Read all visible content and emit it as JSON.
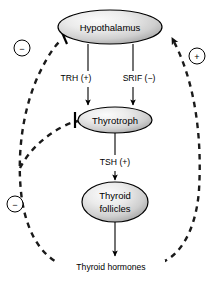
{
  "diagram": {
    "background_color": "#ffffff",
    "nodes": [
      {
        "id": "hypothalamus",
        "label": "Hypothalamus",
        "cx": 110,
        "cy": 27,
        "rx": 52,
        "ry": 17
      },
      {
        "id": "thyrotroph",
        "label": "Thyrotroph",
        "cx": 115,
        "cy": 120,
        "rx": 37,
        "ry": 13
      },
      {
        "id": "thyroid_follicles",
        "label_line1": "Thyroid",
        "label_line2": "follicles",
        "cx": 115,
        "cy": 202,
        "rx": 33,
        "ry": 20
      }
    ],
    "edge_labels": [
      {
        "id": "trh",
        "text": "TRH (+)",
        "x": 76,
        "y": 79
      },
      {
        "id": "srif",
        "text": "SRIF (−)",
        "x": 139,
        "y": 79
      },
      {
        "id": "tsh",
        "text": "TSH (+)",
        "x": 115,
        "y": 163
      }
    ],
    "output_label": {
      "id": "thyroid_hormones",
      "text": "Thyroid hormones",
      "x": 111,
      "y": 268
    },
    "sign_markers": [
      {
        "id": "minus-upper-left",
        "symbol": "−",
        "cx": 22,
        "cy": 48,
        "r": 8
      },
      {
        "id": "plus-upper-right",
        "symbol": "+",
        "cx": 197,
        "cy": 56,
        "r": 8
      },
      {
        "id": "minus-lower-left",
        "symbol": "−",
        "cx": 15,
        "cy": 204,
        "r": 8
      }
    ],
    "node_fill": {
      "gradient_light": "#f4f4f4",
      "gradient_mid": "#d9d9d9",
      "gradient_dark": "#a8a8a8"
    },
    "stroke_color": "#000000"
  }
}
